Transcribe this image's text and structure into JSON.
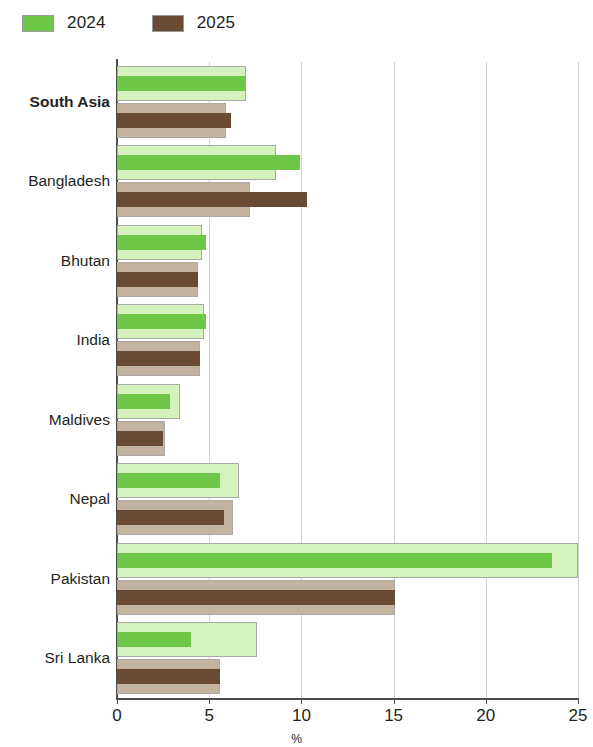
{
  "legend": {
    "entries": [
      {
        "label": "2024",
        "swatch_color": "#6fc74a",
        "name": "legend-2024"
      },
      {
        "label": "2025",
        "swatch_color": "#6b4a33",
        "name": "legend-2025"
      }
    ]
  },
  "colors": {
    "green_light": "#d5f2bd",
    "green_dark": "#6fc74a",
    "brown_light": "#c3b3a1",
    "brown_dark": "#6b4a33",
    "axis": "#4d4d4d",
    "grid": "#d2d2d2",
    "text": "#231f20"
  },
  "chart_data": {
    "type": "bar",
    "orientation": "horizontal",
    "title": "",
    "subtitle": "",
    "xlabel": "%",
    "ylabel": "",
    "xlim": [
      0,
      25
    ],
    "xticks": [
      0,
      5,
      10,
      15,
      20,
      25
    ],
    "xtick_labels": [
      "0",
      "5",
      "10",
      "15",
      "20",
      "25"
    ],
    "grid": true,
    "legend_position": "top-left",
    "categories": [
      "South Asia",
      "Bangladesh",
      "Bhutan",
      "India",
      "Maldives",
      "Nepal",
      "Pakistan",
      "Sri Lanka"
    ],
    "bold_categories": [
      "South Asia"
    ],
    "series": [
      {
        "name": "2024",
        "style": "outer",
        "color": "#d5f2bd",
        "values": [
          7.0,
          8.6,
          4.6,
          4.7,
          3.4,
          6.6,
          25.0,
          7.6
        ]
      },
      {
        "name": "2024",
        "style": "inner",
        "color": "#6fc74a",
        "values": [
          7.0,
          9.9,
          4.8,
          4.8,
          2.9,
          5.6,
          23.6,
          4.0
        ]
      },
      {
        "name": "2025",
        "style": "outer",
        "color": "#c3b3a1",
        "values": [
          5.9,
          7.2,
          4.4,
          4.5,
          2.6,
          6.3,
          15.1,
          5.6
        ]
      },
      {
        "name": "2025",
        "style": "inner",
        "color": "#6b4a33",
        "values": [
          6.2,
          10.3,
          4.4,
          4.5,
          2.5,
          5.8,
          15.1,
          5.6
        ]
      }
    ]
  }
}
